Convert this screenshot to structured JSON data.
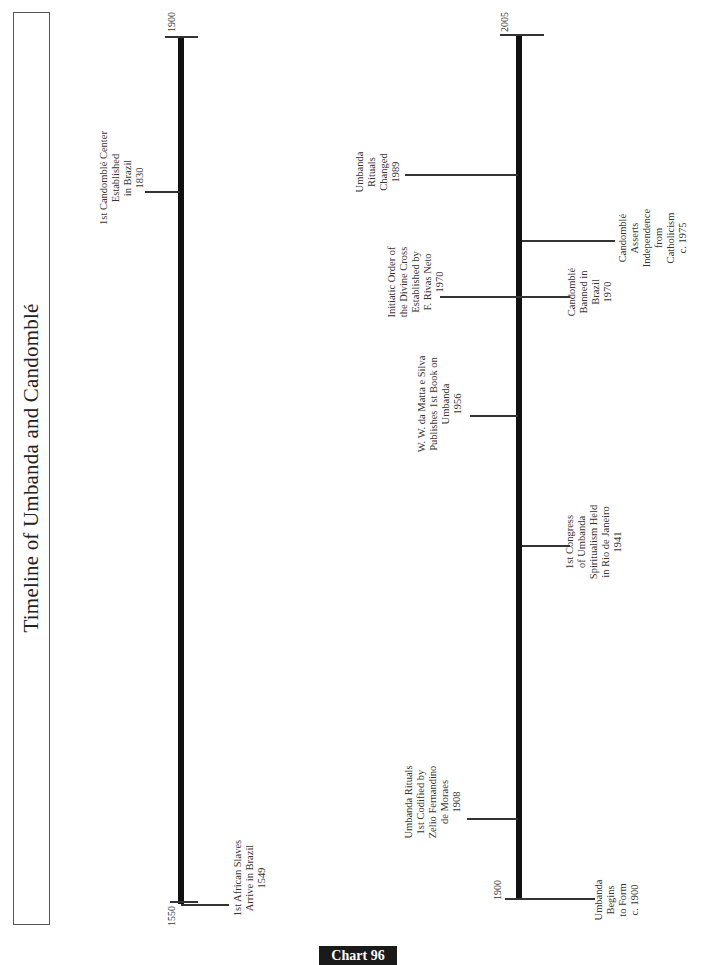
{
  "title": "Timeline of Umbanda and Candomblé",
  "footer_badge": "Chart 96",
  "timelines": [
    {
      "id": "left",
      "start_label": "1550",
      "end_label": "1900",
      "events": [
        {
          "text": "1st Candomblé Center\nEstablished\nin Brazil\n1830",
          "year": "1830",
          "side": "left"
        },
        {
          "text": "1st African Slaves\nArrive in Brazil\n1549",
          "year": "1549",
          "side": "right"
        }
      ]
    },
    {
      "id": "right",
      "start_label": "1900",
      "end_label": "2005",
      "events": [
        {
          "text": "Umbanda\nRituals\nChanged\n1989",
          "year": "1989",
          "side": "left"
        },
        {
          "text": "Candomblé\nAsserts\nIndependence\nfrom\nCatholicism\nc. 1975",
          "year": "c. 1975",
          "side": "right"
        },
        {
          "text": "Initiatic Order of\nthe Divine Cross\nEstablished by\nF. Rivas Neto\n1970",
          "year": "1970",
          "side": "left"
        },
        {
          "text": "Candomblé\nBanned in\nBrazil\n1970",
          "year": "1970",
          "side": "right"
        },
        {
          "text": "W. W. da Matta e Silva\nPublishes 1st Book on\nUmbanda\n1956",
          "year": "1956",
          "side": "left"
        },
        {
          "text": "1st Congress\nof Umbanda\nSpiritualism Held\nin Rio de Janeiro\n1941",
          "year": "1941",
          "side": "right"
        },
        {
          "text": "Umbanda Rituals\n1st Codified by\nZelio Fernandino\nde Moraes\n1908",
          "year": "1908",
          "side": "left"
        },
        {
          "text": "Umbanda\nBegins\nto Form\nc. 1900",
          "year": "c. 1900",
          "side": "right"
        }
      ]
    }
  ]
}
